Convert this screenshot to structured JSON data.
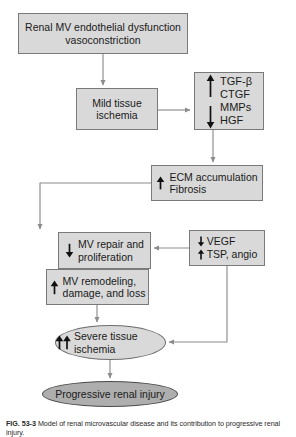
{
  "figure": {
    "caption_label": "FIG. 53-3",
    "caption_text": "Model of renal microvascular disease and its contribution to progressive renal injury."
  },
  "colors": {
    "node_fill": "#d9d9d9",
    "node_border": "#7a7a7a",
    "ellipse_dark_fill": "#aeaeae",
    "background": "#ffffff",
    "text": "#1a1a1a",
    "connector": "#8c8c8c"
  },
  "nodes": {
    "endothelial": {
      "id": "endothelial-dysfunction",
      "shape": "rect",
      "text": "Renal MV endothelial dysfunction\nvasoconstriction"
    },
    "mild_ischemia": {
      "id": "mild-tissue-ischemia",
      "shape": "rect",
      "text": "Mild tissue\nischemia"
    },
    "growth_factors": {
      "id": "growth-factor-panel",
      "shape": "rect",
      "up_group": "TGF-β\nCTGF",
      "down_group": "MMPs\nHGF",
      "up_arrow": "↑",
      "down_arrow": "↓"
    },
    "ecm": {
      "id": "ecm-accumulation-fibrosis",
      "shape": "rect",
      "arrow": "↑",
      "text": "ECM accumulation\nFibrosis"
    },
    "mv_repair": {
      "id": "mv-repair-proliferation",
      "shape": "rect",
      "arrow": "↓",
      "text": "MV repair and\nproliferation"
    },
    "mv_remodeling": {
      "id": "mv-remodeling-damage-loss",
      "shape": "rect",
      "arrow": "↑",
      "text": "MV remodeling,\ndamage, and loss"
    },
    "vegf": {
      "id": "vegf-tsp-angio",
      "shape": "rect",
      "line1_arrow": "↓",
      "line1_text": "VEGF",
      "line2_arrow": "↑",
      "line2_text": "TSP, angio"
    },
    "severe_ischemia": {
      "id": "severe-tissue-ischemia",
      "shape": "ellipse",
      "arrows": "↑↑",
      "text": "Severe tissue\nischemia"
    },
    "progressive_injury": {
      "id": "progressive-renal-injury",
      "shape": "ellipse",
      "text": "Progressive renal injury"
    }
  },
  "edges": [
    {
      "from": "endothelial",
      "to": "mild_ischemia",
      "style": "straight-down"
    },
    {
      "from": "mild_ischemia",
      "to": "growth_factors",
      "style": "straight-right"
    },
    {
      "from": "growth_factors",
      "to": "ecm",
      "style": "straight-down"
    },
    {
      "from": "ecm",
      "to": "mv_repair",
      "style": "left-then-down"
    },
    {
      "from": "vegf",
      "to": "mv_repair",
      "style": "straight-left"
    },
    {
      "from": "vegf",
      "to": "severe_ischemia",
      "style": "down-then-left"
    },
    {
      "from": "mv_remodeling",
      "to": "severe_ischemia",
      "style": "straight-down"
    },
    {
      "from": "severe_ischemia",
      "to": "progressive_injury",
      "style": "straight-down"
    }
  ]
}
